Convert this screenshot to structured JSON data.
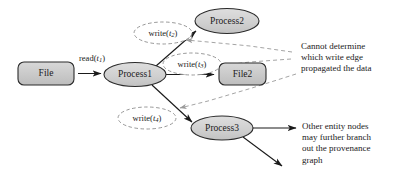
{
  "diagram": {
    "colors": {
      "node_fill": "#c9c9c9",
      "node_fill_light": "#d6d6d6",
      "node_stroke": "#2b2b2b",
      "edge_stroke": "#1a1a1a",
      "dashed_stroke": "#8c8c8c",
      "text": "#1a1a1a",
      "background": "#ffffff"
    },
    "entity_nodes": [
      {
        "id": "file",
        "label": "File",
        "shape": "rounded-rect"
      },
      {
        "id": "file2",
        "label": "File2",
        "shape": "rounded-rect"
      }
    ],
    "process_nodes": [
      {
        "id": "process1",
        "label": "Process1",
        "shape": "ellipse"
      },
      {
        "id": "process2",
        "label": "Process2",
        "shape": "ellipse"
      },
      {
        "id": "process3",
        "label": "Process3",
        "shape": "ellipse"
      }
    ],
    "edge_labels": [
      {
        "id": "read-t1",
        "op": "read",
        "paren_open": "(",
        "var": "t",
        "sub": "1",
        "paren_close": ")",
        "style": "plain"
      },
      {
        "id": "write-t2",
        "op": "write",
        "paren_open": "(",
        "var": "t",
        "sub": "2",
        "paren_close": ")",
        "style": "dashed-ellipse"
      },
      {
        "id": "write-t3",
        "op": "write",
        "paren_open": "(",
        "var": "t",
        "sub": "3",
        "paren_close": ")",
        "style": "dashed-ellipse"
      },
      {
        "id": "write-t4",
        "op": "write",
        "paren_open": "(",
        "var": "t",
        "sub": "4",
        "paren_close": ")",
        "style": "dashed-ellipse"
      }
    ],
    "edges": [
      {
        "from": "file",
        "to": "process1",
        "label": "read-t1",
        "kind": "solid"
      },
      {
        "from": "process1",
        "to": "process2",
        "label": "write-t2",
        "kind": "solid"
      },
      {
        "from": "process1",
        "to": "file2",
        "label": "write-t3",
        "kind": "solid"
      },
      {
        "from": "process1",
        "to": "process3",
        "label": "write-t4",
        "kind": "solid"
      },
      {
        "from": "process3",
        "to": "other-right",
        "label": "",
        "kind": "solid"
      },
      {
        "from": "process3",
        "to": "other-down",
        "label": "",
        "kind": "solid"
      }
    ],
    "annotations": [
      {
        "id": "ambiguity-note",
        "lines": [
          "Cannot determine",
          "which write edge",
          "propagated the data"
        ]
      },
      {
        "id": "branching-note",
        "lines": [
          "Other entity nodes",
          "may further branch",
          "out the provenance",
          "graph"
        ]
      }
    ]
  }
}
